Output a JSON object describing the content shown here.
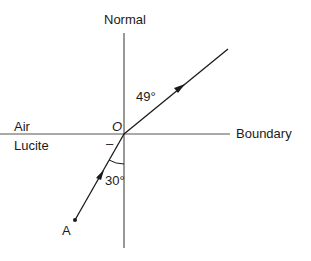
{
  "diagram": {
    "type": "refraction-ray-diagram",
    "labels": {
      "normal": "Normal",
      "boundary": "Boundary",
      "medium_top": "Air",
      "medium_bottom": "Lucite",
      "origin": "O",
      "point_a": "A",
      "angle_refraction": "49°",
      "angle_incidence": "30°",
      "dash_mark": "–"
    },
    "angles": {
      "incidence_deg": 30,
      "refraction_deg": 49
    },
    "colors": {
      "line": "#1a1a1a",
      "axis": "#555555",
      "background": "#ffffff"
    }
  }
}
